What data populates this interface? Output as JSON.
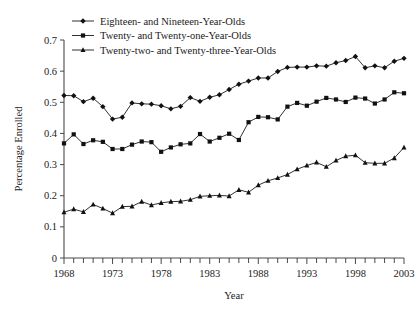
{
  "chart_data": {
    "type": "line",
    "title": "",
    "xlabel": "Year",
    "ylabel": "Percentage Enrolled",
    "xlim": [
      1968,
      2003
    ],
    "ylim": [
      0,
      0.7
    ],
    "grid": false,
    "legend_position": "top-left",
    "x_tick_labels": [
      "1968",
      "1973",
      "1978",
      "1983",
      "1988",
      "1993",
      "1998",
      "2003"
    ],
    "x_tick_values": [
      1968,
      1973,
      1978,
      1983,
      1988,
      1993,
      1998,
      2003
    ],
    "y_tick_labels": [
      "0",
      "0.1",
      "0.2",
      "0.3",
      "0.4",
      "0.5",
      "0.6",
      "0.7"
    ],
    "y_tick_values": [
      0,
      0.1,
      0.2,
      0.3,
      0.4,
      0.5,
      0.6,
      0.7
    ],
    "x": [
      1968,
      1969,
      1970,
      1971,
      1972,
      1973,
      1974,
      1975,
      1976,
      1977,
      1978,
      1979,
      1980,
      1981,
      1982,
      1983,
      1984,
      1985,
      1986,
      1987,
      1988,
      1989,
      1990,
      1991,
      1992,
      1993,
      1994,
      1995,
      1996,
      1997,
      1998,
      1999,
      2000,
      2001,
      2002,
      2003
    ],
    "series": [
      {
        "name": "Eighteen- and Nineteen-Year-Olds",
        "marker": "diamond",
        "values": [
          0.522,
          0.521,
          0.502,
          0.513,
          0.486,
          0.446,
          0.452,
          0.498,
          0.495,
          0.494,
          0.489,
          0.479,
          0.487,
          0.515,
          0.503,
          0.516,
          0.524,
          0.541,
          0.558,
          0.568,
          0.578,
          0.578,
          0.599,
          0.612,
          0.613,
          0.613,
          0.617,
          0.616,
          0.627,
          0.634,
          0.647,
          0.611,
          0.617,
          0.611,
          0.632,
          0.641
        ]
      },
      {
        "name": "Twenty- and Twenty-one-Year-Olds",
        "marker": "square",
        "values": [
          0.368,
          0.397,
          0.366,
          0.378,
          0.373,
          0.35,
          0.35,
          0.364,
          0.374,
          0.372,
          0.341,
          0.355,
          0.365,
          0.368,
          0.398,
          0.374,
          0.386,
          0.399,
          0.379,
          0.436,
          0.453,
          0.452,
          0.445,
          0.486,
          0.498,
          0.489,
          0.502,
          0.514,
          0.509,
          0.501,
          0.515,
          0.512,
          0.496,
          0.509,
          0.532,
          0.529
        ]
      },
      {
        "name": "Twenty-two- and Twenty-three-Year-Olds",
        "marker": "triangle",
        "values": [
          0.147,
          0.157,
          0.148,
          0.172,
          0.159,
          0.144,
          0.165,
          0.166,
          0.181,
          0.17,
          0.177,
          0.181,
          0.182,
          0.187,
          0.198,
          0.2,
          0.201,
          0.199,
          0.219,
          0.211,
          0.234,
          0.248,
          0.257,
          0.268,
          0.285,
          0.297,
          0.307,
          0.293,
          0.313,
          0.327,
          0.33,
          0.306,
          0.304,
          0.304,
          0.321,
          0.355
        ]
      }
    ]
  }
}
